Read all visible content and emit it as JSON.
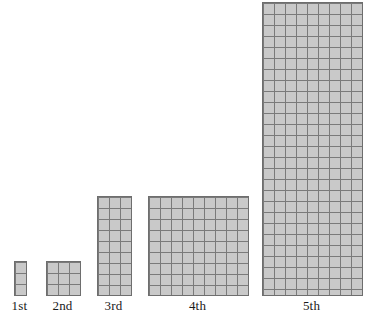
{
  "figure": {
    "title": "",
    "background_color": "#ffffff",
    "cell_fill_color": "#c9c9c9",
    "grid_line_color": "#7a7a7a",
    "outline_color": "#6e6e6e",
    "cell_size_px": 11
  },
  "chart_data": {
    "type": "bar",
    "title": "",
    "xlabel": "",
    "ylabel": "",
    "grid": true,
    "legend": "none",
    "categories": [
      "1st",
      "2nd",
      "3rd",
      "4th",
      "5th"
    ],
    "values": [
      3,
      9,
      27,
      81,
      243
    ],
    "series": [
      {
        "name": "area (unit squares)",
        "values": [
          3,
          9,
          27,
          81,
          243
        ]
      },
      {
        "name": "columns",
        "values": [
          1,
          3,
          3,
          9,
          9
        ]
      },
      {
        "name": "rows",
        "values": [
          3,
          3,
          9,
          9,
          27
        ]
      }
    ],
    "annotations": []
  },
  "shapes": [
    {
      "id": "shape-1",
      "label": "1st",
      "cols": 1,
      "rows": 3,
      "cells": 3,
      "x": 14,
      "y": 261,
      "width": 11,
      "height": 33,
      "label_x": 0,
      "label_y": 298,
      "label_w": 39
    },
    {
      "id": "shape-2",
      "label": "2nd",
      "cols": 3,
      "rows": 3,
      "cells": 9,
      "x": 46,
      "y": 261,
      "width": 33,
      "height": 33,
      "label_x": 43,
      "label_y": 298,
      "label_w": 39
    },
    {
      "id": "shape-3",
      "label": "3rd",
      "cols": 3,
      "rows": 9,
      "cells": 27,
      "x": 97,
      "y": 196,
      "width": 33,
      "height": 98,
      "label_x": 94,
      "label_y": 298,
      "label_w": 39
    },
    {
      "id": "shape-4",
      "label": "4th",
      "cols": 9,
      "rows": 9,
      "cells": 81,
      "x": 148,
      "y": 196,
      "width": 99,
      "height": 98,
      "label_x": 178,
      "label_y": 298,
      "label_w": 39
    },
    {
      "id": "shape-5",
      "label": "5th",
      "cols": 9,
      "rows": 27,
      "cells": 243,
      "x": 262,
      "y": 2,
      "width": 99,
      "height": 292,
      "label_x": 292,
      "label_y": 298,
      "label_w": 39
    }
  ]
}
